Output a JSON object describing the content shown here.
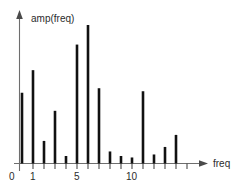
{
  "chart_data": {
    "type": "bar",
    "title": "",
    "subtitle": "",
    "xlabel": "freq",
    "ylabel": "amp(freq)",
    "grid": false,
    "legend": null,
    "xlim": [
      0,
      16
    ],
    "ylim": [
      0,
      100
    ],
    "origin_label": "0",
    "x_tick_labels": [
      "1",
      "5",
      "10"
    ],
    "x_tick_values": [
      1,
      5,
      10
    ],
    "x_ticks_all": [
      1,
      2,
      3,
      4,
      5,
      6,
      7,
      8,
      9,
      10,
      11,
      12,
      13,
      14,
      15
    ],
    "categories": [
      0,
      1,
      2,
      3,
      4,
      5,
      6,
      7,
      8,
      9,
      10,
      11,
      12,
      13,
      14
    ],
    "values": [
      47,
      62,
      15,
      35,
      5,
      79,
      92,
      50,
      8,
      5,
      4,
      48,
      6,
      11,
      19
    ],
    "bar_color": "#111111",
    "axis_color": "#6e6e6e",
    "background_color": "#ffffff"
  },
  "labels": {
    "y_axis_title": "amp(freq)",
    "x_axis_title": "freq",
    "origin": "0",
    "tick_1": "1",
    "tick_5": "5",
    "tick_10": "10"
  }
}
